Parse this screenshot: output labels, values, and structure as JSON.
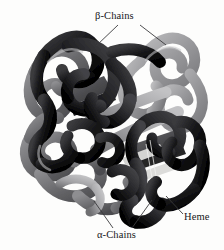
{
  "figure": {
    "name": "hemoglobin-structure",
    "background_color": "#fdfdfc",
    "annotations": {
      "beta_chains": "β-Chains",
      "alpha_chains": "α-Chains",
      "heme": "Heme"
    },
    "colors": {
      "chain_dark": "#1a1a1c",
      "chain_dark_mid": "#2e2e31",
      "chain_mid": "#6f6f72",
      "chain_light": "#9a9a9d",
      "chain_lighter": "#b4b4b6",
      "heme_plate": "#4a4a4d",
      "heme_plate_light": "#d8d8d6",
      "leader_line": "#3a3a3c",
      "label_text": "#17171a"
    },
    "leader_lines": {
      "beta_left_target": "120,24 -> 96,46",
      "beta_right_target": "140,24 -> 165,44",
      "alpha_left_target": "114,228 -> 94,202",
      "alpha_right_target": "132,228 -> 152,200",
      "heme_target": "183,214 -> 166,196"
    }
  }
}
